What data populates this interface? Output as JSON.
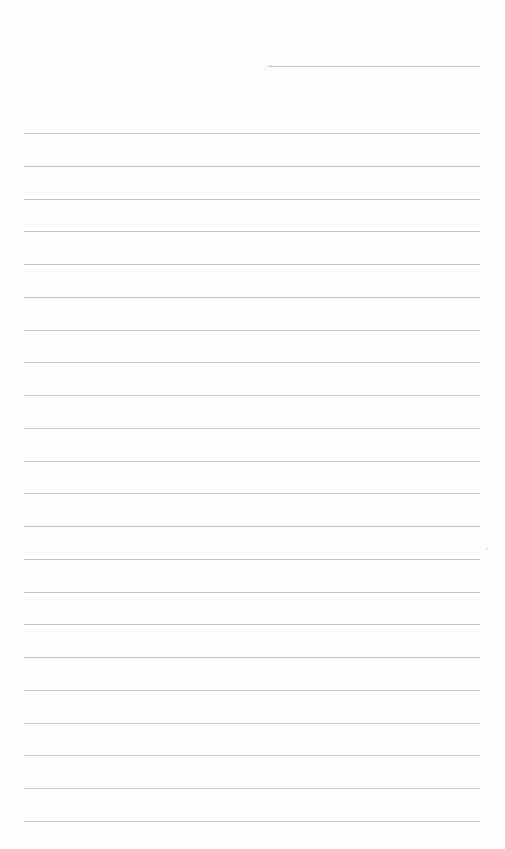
{
  "document": {
    "type": "lined-paper",
    "header_line": {
      "left": 268,
      "top": 66,
      "width": 212
    },
    "rules": {
      "left": 24,
      "width": 456,
      "first_top": 133,
      "spacing": 32.75,
      "count": 22
    },
    "line_color": "#c4c4c4",
    "background": "#fefefe"
  }
}
